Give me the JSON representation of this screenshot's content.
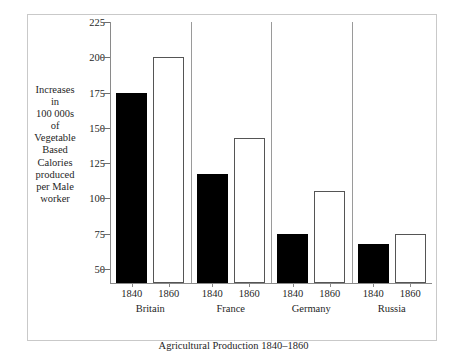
{
  "chart_data": {
    "type": "bar",
    "title": "Agricultural Production 1840–1860",
    "ylabel": "Increases in 100 000s of Vegetable Based Calories produced per Male worker",
    "ylabel_lines": [
      "Increases",
      "in",
      "100 000s",
      "of",
      "Vegetable",
      "Based",
      "Calories",
      "produced",
      "per Male",
      "worker"
    ],
    "xlabel": "",
    "categories": [
      "Britain",
      "France",
      "Germany",
      "Russia"
    ],
    "series": [
      {
        "name": "1840",
        "style": "filled",
        "values": [
          175,
          117,
          75,
          68
        ]
      },
      {
        "name": "1860",
        "style": "hollow",
        "values": [
          200,
          143,
          105,
          75
        ]
      }
    ],
    "ylim": [
      40,
      225
    ],
    "yticks": [
      225,
      200,
      175,
      150,
      125,
      100,
      75,
      50
    ],
    "ytick_labels": [
      "225",
      "200",
      "175",
      "150",
      "125",
      "100",
      "75",
      "50"
    ],
    "grid": false,
    "legend": "none",
    "colors": {
      "filled_bar": "#000000",
      "hollow_bar": "#ffffff",
      "bar_outline": "#555555",
      "axis": "#8a8a8a",
      "frame": "#c9c9c9",
      "text": "#1f1f1f",
      "background": "#ffffff"
    }
  }
}
